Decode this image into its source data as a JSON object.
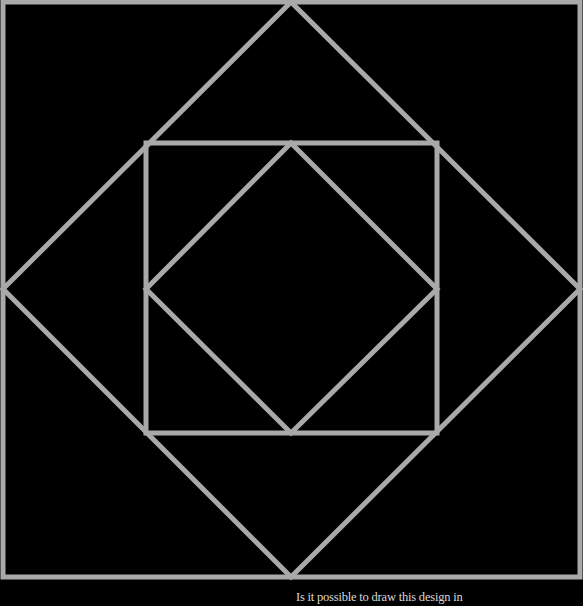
{
  "figure": {
    "background_color": "#000000",
    "line_color": "#a9a9a9",
    "line_width": 5,
    "shapes": [
      {
        "name": "outer-square",
        "type": "square",
        "points": [
          [
            3,
            2
          ],
          [
            580,
            2
          ],
          [
            580,
            577
          ],
          [
            3,
            577
          ]
        ]
      },
      {
        "name": "outer-diamond",
        "type": "diamond",
        "points": [
          [
            291,
            2
          ],
          [
            580,
            289
          ],
          [
            291,
            577
          ],
          [
            3,
            289
          ]
        ]
      },
      {
        "name": "middle-square",
        "type": "square",
        "points": [
          [
            146,
            143
          ],
          [
            437,
            143
          ],
          [
            437,
            433
          ],
          [
            146,
            433
          ]
        ]
      },
      {
        "name": "inner-diamond",
        "type": "diamond",
        "points": [
          [
            291,
            143
          ],
          [
            437,
            289
          ],
          [
            291,
            433
          ],
          [
            146,
            289
          ]
        ]
      }
    ]
  },
  "caption": {
    "text": "Is it possible to draw this design in"
  }
}
